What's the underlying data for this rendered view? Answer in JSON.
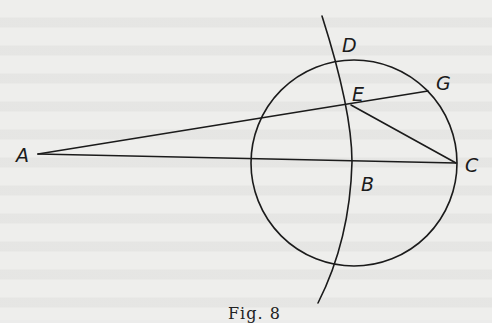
{
  "figure": {
    "caption": "Fig. 8",
    "labels": {
      "A": "A",
      "B": "B",
      "C": "C",
      "D": "D",
      "E": "E",
      "G": "G"
    },
    "elements": [
      "circle centered near B",
      "line A–C",
      "line A–G through E",
      "line E–C",
      "arc through D, E, B"
    ],
    "colors": {
      "ink": "#1b1b1b",
      "paper": "#eeeeec"
    }
  }
}
